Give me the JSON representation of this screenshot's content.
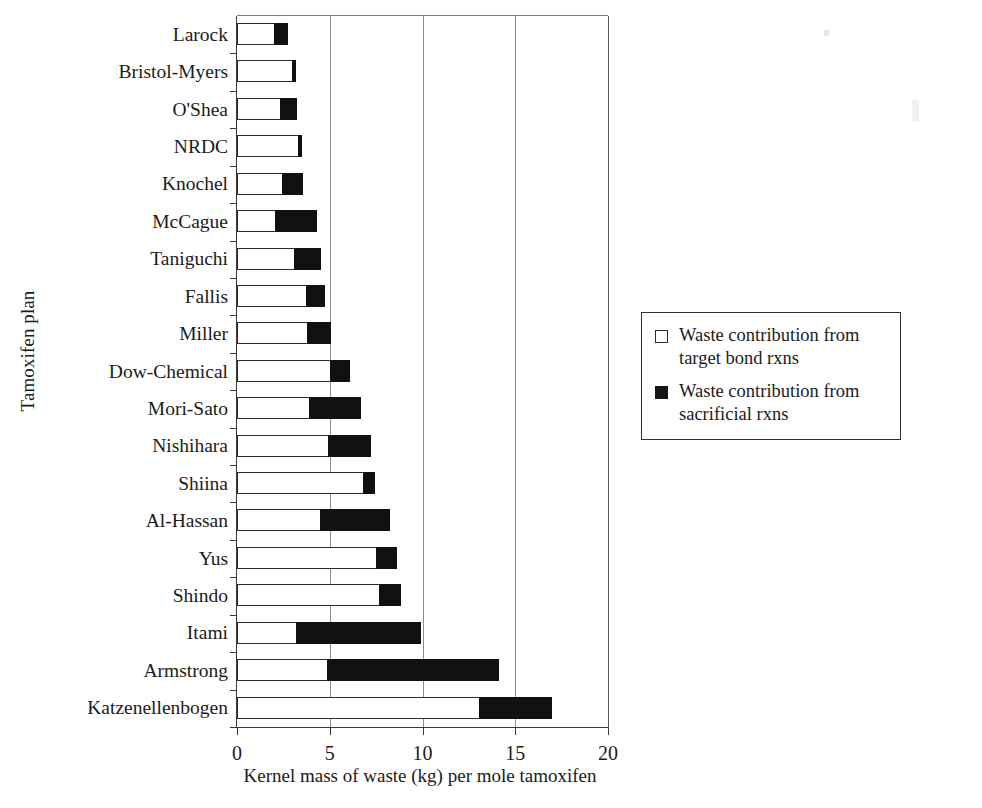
{
  "chart_data": {
    "type": "bar",
    "orientation": "horizontal",
    "stacked": true,
    "title": "",
    "xlabel": "Kernel mass of waste (kg) per mole tamoxifen",
    "ylabel": "Tamoxifen plan",
    "xlim": [
      0,
      20
    ],
    "xticks": [
      0,
      5,
      10,
      15,
      20
    ],
    "xtick_labels": [
      "0",
      "5",
      "10",
      "15",
      "20"
    ],
    "grid": "vertical",
    "legend_position": "right",
    "categories": [
      "Larock",
      "Bristol-Myers",
      "O'Shea",
      "NRDC",
      "Knochel",
      "McCague",
      "Taniguchi",
      "Fallis",
      "Miller",
      "Dow-Chemical",
      "Mori-Sato",
      "Nishihara",
      "Shiina",
      "Al-Hassan",
      "Yus",
      "Shindo",
      "Itami",
      "Armstrong",
      "Katzenellenbogen"
    ],
    "series": [
      {
        "name": "Waste contribution from target bond rxns",
        "color": "#ffffff",
        "values": [
          2.0,
          2.95,
          2.3,
          3.3,
          2.4,
          2.05,
          3.05,
          3.7,
          3.8,
          5.0,
          3.9,
          4.9,
          6.8,
          4.5,
          7.5,
          7.65,
          3.2,
          4.85,
          13.05
        ]
      },
      {
        "name": "Waste contribution from sacrificial rxns",
        "color": "#111111",
        "values": [
          0.75,
          0.25,
          0.95,
          0.2,
          1.15,
          2.25,
          1.5,
          1.05,
          1.25,
          1.1,
          2.8,
          2.35,
          0.65,
          3.75,
          1.1,
          1.2,
          6.7,
          9.25,
          3.95
        ]
      }
    ],
    "totals": [
      2.75,
      3.2,
      3.25,
      3.5,
      3.55,
      4.3,
      4.55,
      4.75,
      5.05,
      6.1,
      6.7,
      7.25,
      7.45,
      8.25,
      8.6,
      8.85,
      9.9,
      14.1,
      17.0
    ]
  },
  "legend": {
    "items": [
      {
        "swatch": "open-square",
        "line1": "Waste contribution from",
        "line2": "target bond rxns"
      },
      {
        "swatch": "filled-square",
        "line1": "Waste contribution from",
        "line2": "sacrificial rxns"
      }
    ]
  }
}
